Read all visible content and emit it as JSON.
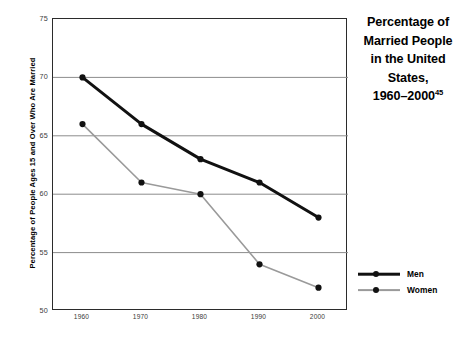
{
  "chart_data": {
    "type": "line",
    "title_lines": [
      "Percentage of",
      "Married People",
      "in the United",
      "States,",
      "1960–2000"
    ],
    "title_superscript": "45",
    "xlabel": "",
    "ylabel": "Percentage of People Ages 15 and Over Who Are Married",
    "categories": [
      "1960",
      "1970",
      "1980",
      "1990",
      "2000"
    ],
    "x": [
      1960,
      1970,
      1980,
      1990,
      2000
    ],
    "series": [
      {
        "name": "Men",
        "values": [
          70,
          66,
          63,
          61,
          58
        ],
        "color": "#111111",
        "line_width": 3.0
      },
      {
        "name": "Women",
        "values": [
          66,
          61,
          60,
          54,
          52
        ],
        "color": "#9a9a9a",
        "line_width": 1.6
      }
    ],
    "ylim": [
      50,
      75
    ],
    "yticks": [
      75,
      70,
      65,
      60,
      55,
      50
    ],
    "ytick_labels": [
      "75",
      "70",
      "65",
      "60",
      "55",
      "50"
    ],
    "xlim": [
      1955,
      2005
    ],
    "grid": "horizontal",
    "gridline_color": "#8c8c8c",
    "legend_position": "right-lower",
    "frame_color": "#2b2b2b",
    "background": "#ffffff"
  },
  "legend": {
    "items": [
      {
        "label": "Men"
      },
      {
        "label": "Women"
      }
    ]
  },
  "axes": {
    "y_title": "Percentage of People Ages 15 and Over Who Are Married"
  }
}
